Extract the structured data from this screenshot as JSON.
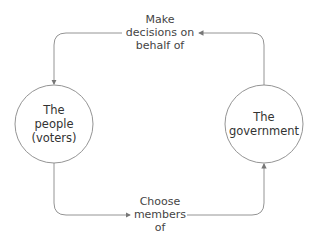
{
  "diagram": {
    "type": "cycle",
    "nodes": [
      {
        "id": "people",
        "label_lines": [
          "The",
          "people",
          "(voters)"
        ]
      },
      {
        "id": "government",
        "label_lines": [
          "The",
          "government"
        ]
      }
    ],
    "edges": [
      {
        "from": "government",
        "to": "people",
        "label_lines": [
          "Make",
          "decisions on",
          "behalf of"
        ]
      },
      {
        "from": "people",
        "to": "government",
        "label_lines": [
          "Choose",
          "members",
          "of"
        ]
      }
    ],
    "colors": {
      "stroke": "#888888",
      "text": "#444444",
      "background": "#ffffff"
    }
  }
}
